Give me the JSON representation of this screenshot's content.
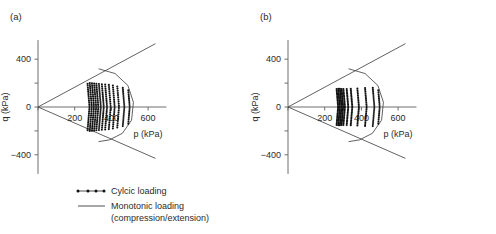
{
  "figure": {
    "panels": [
      {
        "key": "a",
        "label": "(a)",
        "xlabel": "p (kPa)",
        "ylabel": "q (kPa)"
      },
      {
        "key": "b",
        "label": "(b)",
        "xlabel": "p (kPa)",
        "ylabel": "q (kPa)"
      }
    ],
    "legend": {
      "items": [
        {
          "key": "cyclic",
          "label": "Cylcic loading",
          "marker": "line-with-dots-marker"
        },
        {
          "key": "monotonic",
          "label": "Monotonic loading",
          "label_line2": "(compression/extension)",
          "marker": "solid-line-marker"
        }
      ]
    }
  },
  "chart_data": [
    {
      "type": "scatter",
      "panel": "a",
      "title": "(a)",
      "xlabel": "p (kPa)",
      "ylabel": "q (kPa)",
      "xlim": [
        0,
        700
      ],
      "ylim": [
        -560,
        560
      ],
      "xticks": [
        0,
        200,
        400,
        600
      ],
      "xtick_labels": [
        "",
        "200",
        "400",
        "600"
      ],
      "yticks": [
        -400,
        -200,
        0,
        200,
        400
      ],
      "ytick_labels": [
        "-400",
        "",
        "0",
        "",
        "400"
      ],
      "grid": false,
      "legend_position": "below-figure",
      "series": [
        {
          "name": "Monotonic loading (compression)",
          "type": "line",
          "x": [
            0,
            640
          ],
          "y": [
            0,
            530
          ]
        },
        {
          "name": "Monotonic loading (extension)",
          "type": "line",
          "x": [
            0,
            640
          ],
          "y": [
            0,
            -430
          ]
        },
        {
          "name": "Monotonic cap (compression branch)",
          "type": "line",
          "comment": "curved cap from upper envelope around to lower envelope",
          "x": [
            330,
            420,
            490,
            520,
            510,
            460,
            390,
            330
          ],
          "y": [
            320,
            280,
            180,
            40,
            -110,
            -220,
            -275,
            -290
          ]
        },
        {
          "name": "Cyclic loading arcs",
          "type": "scatter",
          "arcs": [
            {
              "p_center": 270,
              "q_amplitude": 195,
              "n_points": 26
            },
            {
              "p_center": 282,
              "q_amplitude": 200,
              "n_points": 26
            },
            {
              "p_center": 294,
              "q_amplitude": 198,
              "n_points": 26
            },
            {
              "p_center": 306,
              "q_amplitude": 196,
              "n_points": 26
            },
            {
              "p_center": 318,
              "q_amplitude": 194,
              "n_points": 26
            },
            {
              "p_center": 332,
              "q_amplitude": 192,
              "n_points": 24
            },
            {
              "p_center": 348,
              "q_amplitude": 190,
              "n_points": 24
            },
            {
              "p_center": 366,
              "q_amplitude": 188,
              "n_points": 24
            },
            {
              "p_center": 386,
              "q_amplitude": 185,
              "n_points": 22
            },
            {
              "p_center": 408,
              "q_amplitude": 180,
              "n_points": 22
            },
            {
              "p_center": 432,
              "q_amplitude": 172,
              "n_points": 20
            },
            {
              "p_center": 462,
              "q_amplitude": 160,
              "n_points": 20
            },
            {
              "p_center": 492,
              "q_amplitude": 140,
              "n_points": 18
            }
          ]
        }
      ]
    },
    {
      "type": "scatter",
      "panel": "b",
      "title": "(b)",
      "xlabel": "p (kPa)",
      "ylabel": "q (kPa)",
      "xlim": [
        0,
        700
      ],
      "ylim": [
        -560,
        560
      ],
      "xticks": [
        0,
        200,
        400,
        600
      ],
      "xtick_labels": [
        "",
        "200",
        "400",
        "600"
      ],
      "yticks": [
        -400,
        -200,
        0,
        200,
        400
      ],
      "ytick_labels": [
        "-400",
        "",
        "0",
        "",
        "400"
      ],
      "grid": false,
      "legend_position": "below-figure",
      "series": [
        {
          "name": "Monotonic loading (compression)",
          "type": "line",
          "x": [
            0,
            640
          ],
          "y": [
            0,
            530
          ]
        },
        {
          "name": "Monotonic loading (extension)",
          "type": "line",
          "x": [
            0,
            640
          ],
          "y": [
            0,
            -430
          ]
        },
        {
          "name": "Monotonic cap (compression branch)",
          "type": "line",
          "x": [
            330,
            420,
            490,
            520,
            510,
            460,
            390,
            330
          ],
          "y": [
            320,
            280,
            180,
            40,
            -110,
            -220,
            -275,
            -290
          ]
        },
        {
          "name": "Cyclic loading arcs",
          "type": "scatter",
          "arcs": [
            {
              "p_center": 265,
              "q_amplitude": 150,
              "n_points": 26
            },
            {
              "p_center": 274,
              "q_amplitude": 152,
              "n_points": 26
            },
            {
              "p_center": 283,
              "q_amplitude": 152,
              "n_points": 26
            },
            {
              "p_center": 292,
              "q_amplitude": 150,
              "n_points": 26
            },
            {
              "p_center": 302,
              "q_amplitude": 150,
              "n_points": 24
            },
            {
              "p_center": 320,
              "q_amplitude": 150,
              "n_points": 24
            },
            {
              "p_center": 342,
              "q_amplitude": 152,
              "n_points": 24
            },
            {
              "p_center": 378,
              "q_amplitude": 155,
              "n_points": 22
            },
            {
              "p_center": 420,
              "q_amplitude": 158,
              "n_points": 22
            },
            {
              "p_center": 462,
              "q_amplitude": 160,
              "n_points": 20
            },
            {
              "p_center": 492,
              "q_amplitude": 140,
              "n_points": 18
            }
          ]
        }
      ]
    }
  ]
}
